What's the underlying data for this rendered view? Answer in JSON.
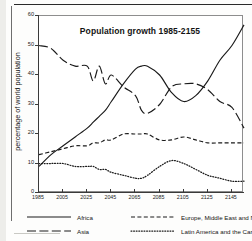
{
  "chart_data": {
    "type": "line",
    "title": "Population growth 1985-2155",
    "xlabel": "",
    "ylabel": "percentage of world population",
    "xlim": [
      1985,
      2155
    ],
    "ylim": [
      0,
      60
    ],
    "grid": false,
    "legend_position": "bottom",
    "xticks": [
      "1985",
      "2005",
      "2025",
      "2045",
      "2065",
      "2085",
      "2105",
      "2125",
      "2145"
    ],
    "yticks": [
      "0",
      "10",
      "20",
      "30",
      "40",
      "50",
      "60"
    ],
    "x": [
      1985,
      1995,
      2005,
      2015,
      2025,
      2030,
      2035,
      2040,
      2045,
      2055,
      2065,
      2070,
      2075,
      2085,
      2095,
      2105,
      2115,
      2125,
      2135,
      2145,
      2155
    ],
    "series": [
      {
        "name": "Asia",
        "style": "long-dash",
        "color": "#1a1a1a",
        "values": [
          50,
          49,
          45,
          43,
          43,
          38,
          43,
          37,
          40,
          36,
          33,
          28,
          27,
          30,
          36,
          37,
          37,
          35,
          31,
          29,
          22
        ]
      },
      {
        "name": "Africa",
        "style": "solid",
        "color": "#1a1a1a",
        "values": [
          9,
          13,
          16,
          19,
          22,
          24,
          26,
          28,
          31,
          37,
          42,
          43,
          43,
          40,
          34,
          31,
          33,
          38,
          45,
          50,
          57
        ]
      },
      {
        "name": "Europe, Middle East and North Africa",
        "style": "dash",
        "color": "#1a1a1a",
        "values": [
          13,
          14,
          15,
          16,
          16,
          17,
          17,
          18,
          18,
          20,
          20,
          20,
          20,
          18,
          18,
          19,
          18,
          17,
          17,
          17,
          17
        ]
      },
      {
        "name": "Latin America and the Caribbean",
        "style": "dot",
        "color": "#1a1a1a",
        "values": [
          10,
          10,
          10,
          9,
          9,
          9,
          8,
          8,
          7,
          6,
          5,
          5,
          6,
          9,
          11,
          10,
          8,
          6,
          5,
          4,
          4
        ]
      }
    ]
  },
  "legend": {
    "rows": [
      [
        {
          "label": "Africa",
          "style": "solid"
        },
        {
          "label": "Europe, Middle East and North Africa",
          "style": "dash"
        }
      ],
      [
        {
          "label": "Asia",
          "style": "long-dash"
        },
        {
          "label": "Latin America and the Caribbean",
          "style": "dot"
        }
      ]
    ]
  }
}
